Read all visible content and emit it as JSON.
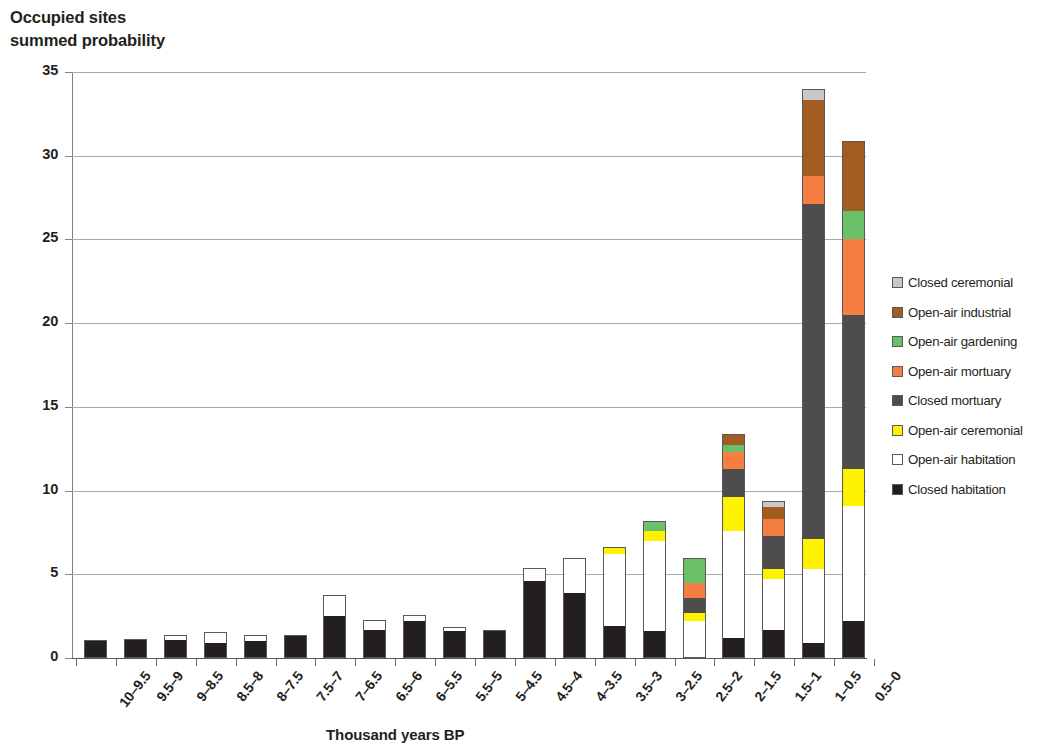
{
  "chart_data": {
    "type": "bar",
    "title": "Occupied sites summed probability",
    "subtitle": "",
    "ylabel_line1": "Occupied sites",
    "ylabel_line2": "summed probability",
    "xlabel": "Thousand years BP",
    "ylim": [
      0,
      35
    ],
    "yticks": [
      0,
      5,
      10,
      15,
      20,
      25,
      30,
      35
    ],
    "grid": true,
    "stacked": true,
    "legend_position": "right",
    "categories": [
      "10–9.5",
      "9.5–9",
      "9–8.5",
      "8.5–8",
      "8–7.5",
      "7.5–7",
      "7–6.5",
      "6.5–6",
      "6–5.5",
      "5.5–5",
      "5–4.5",
      "4.5–4",
      "4–3.5",
      "3.5–3",
      "3–2.5",
      "2.5–2",
      "2–1.5",
      "1.5–1",
      "1–0.5",
      "0.5–0"
    ],
    "series": [
      {
        "name": "Closed habitation",
        "color": "#231f20",
        "values": [
          1.0,
          1.1,
          1.1,
          0.9,
          1.0,
          1.3,
          2.5,
          1.7,
          2.2,
          1.6,
          1.6,
          4.6,
          3.9,
          1.9,
          1.6,
          0.0,
          1.2,
          1.7,
          0.9,
          2.2
        ]
      },
      {
        "name": "Open-air habitation",
        "color": "#ffffff",
        "values": [
          0.0,
          0.0,
          0.2,
          0.6,
          0.3,
          0.0,
          1.2,
          0.5,
          0.3,
          0.2,
          0.0,
          0.7,
          2.0,
          4.3,
          5.4,
          2.2,
          6.4,
          3.0,
          4.4,
          6.9
        ]
      },
      {
        "name": "Open-air ceremonial",
        "color": "#fff200",
        "values": [
          0.0,
          0.0,
          0.0,
          0.0,
          0.0,
          0.0,
          0.0,
          0.0,
          0.0,
          0.0,
          0.0,
          0.0,
          0.0,
          0.4,
          0.6,
          0.5,
          2.0,
          0.6,
          1.8,
          2.2
        ]
      },
      {
        "name": "Closed mortuary",
        "color": "#4d4d4d",
        "values": [
          0.0,
          0.0,
          0.0,
          0.0,
          0.0,
          0.0,
          0.0,
          0.0,
          0.0,
          0.0,
          0.0,
          0.0,
          0.0,
          0.0,
          0.0,
          0.9,
          1.7,
          2.0,
          20.0,
          9.2
        ]
      },
      {
        "name": "Open-air mortuary",
        "color": "#f57f42",
        "values": [
          0.0,
          0.0,
          0.0,
          0.0,
          0.0,
          0.0,
          0.0,
          0.0,
          0.0,
          0.0,
          0.0,
          0.0,
          0.0,
          0.0,
          0.0,
          0.9,
          1.0,
          1.0,
          1.7,
          4.5
        ]
      },
      {
        "name": "Open-air gardening",
        "color": "#6abf69",
        "values": [
          0.0,
          0.0,
          0.0,
          0.0,
          0.0,
          0.0,
          0.0,
          0.0,
          0.0,
          0.0,
          0.0,
          0.0,
          0.0,
          0.0,
          0.5,
          1.4,
          0.4,
          0.0,
          0.0,
          1.7
        ]
      },
      {
        "name": "Open-air industrial",
        "color": "#a35c20",
        "values": [
          0.0,
          0.0,
          0.0,
          0.0,
          0.0,
          0.0,
          0.0,
          0.0,
          0.0,
          0.0,
          0.0,
          0.0,
          0.0,
          0.0,
          0.0,
          0.0,
          0.6,
          0.7,
          4.5,
          4.1
        ]
      },
      {
        "name": "Closed ceremonial",
        "color": "#c8c9c7",
        "values": [
          0.0,
          0.0,
          0.0,
          0.0,
          0.0,
          0.0,
          0.0,
          0.0,
          0.0,
          0.0,
          0.0,
          0.0,
          0.0,
          0.0,
          0.0,
          0.0,
          0.0,
          0.3,
          0.6,
          0.0
        ]
      }
    ],
    "totals": [
      1.0,
      1.1,
      1.3,
      1.5,
      1.3,
      1.3,
      3.7,
      2.2,
      2.5,
      1.8,
      1.6,
      5.3,
      5.9,
      6.6,
      8.1,
      5.9,
      13.3,
      9.3,
      33.9,
      30.8
    ]
  },
  "legend": {
    "items": [
      {
        "label": "Closed ceremonial",
        "color": "#c8c9c7"
      },
      {
        "label": "Open-air industrial",
        "color": "#a35c20"
      },
      {
        "label": "Open-air gardening",
        "color": "#6abf69"
      },
      {
        "label": "Open-air mortuary",
        "color": "#f57f42"
      },
      {
        "label": "Closed mortuary",
        "color": "#4d4d4d"
      },
      {
        "label": "Open-air ceremonial",
        "color": "#fff200"
      },
      {
        "label": "Open-air habitation",
        "color": "#ffffff"
      },
      {
        "label": "Closed habitation",
        "color": "#231f20"
      }
    ]
  }
}
